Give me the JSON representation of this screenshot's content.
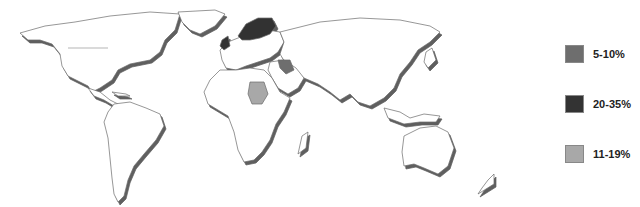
{
  "map": {
    "title": "",
    "type": "world-choropleth",
    "colors": {
      "land": "#ffffff",
      "border": "#6a6a6a",
      "coast_shadow": "#5e5e5e",
      "cat_5_10": "#6e6e6e",
      "cat_20_35": "#333333",
      "cat_11_19": "#a8a8a8"
    },
    "highlighted_regions": [
      {
        "region": "Brazil",
        "category": "20-35%"
      },
      {
        "region": "Scandinavia (Norway, Sweden, Finland)",
        "category": "20-35%"
      },
      {
        "region": "United Kingdom",
        "category": "20-35%"
      },
      {
        "region": "Sudan",
        "category": "11-19%"
      },
      {
        "region": "Iraq / Syria",
        "category": "5-10%"
      }
    ]
  },
  "legend": {
    "items": [
      {
        "label": "5-10%",
        "color": "#6e6e6e"
      },
      {
        "label": "20-35%",
        "color": "#333333"
      },
      {
        "label": "11-19%",
        "color": "#a8a8a8"
      }
    ]
  }
}
